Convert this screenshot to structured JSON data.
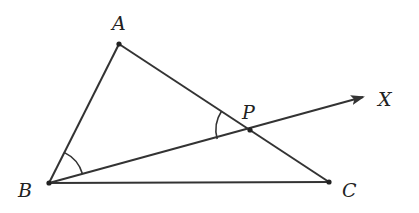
{
  "diagram": {
    "type": "geometry-triangle",
    "points": {
      "A": {
        "label": "A",
        "x": 119,
        "y": 44
      },
      "B": {
        "label": "B",
        "x": 49,
        "y": 183
      },
      "C": {
        "label": "C",
        "x": 329,
        "y": 182
      },
      "P": {
        "label": "P",
        "x": 250,
        "y": 130
      },
      "X": {
        "label": "X",
        "x": 363,
        "y": 97
      }
    },
    "segments": [
      "AB",
      "AC",
      "BC"
    ],
    "rays": [
      "BX"
    ],
    "angle_marks": [
      {
        "vertex": "B",
        "between": [
          "A",
          "P"
        ],
        "style": "single-arc"
      },
      {
        "vertex": "P",
        "between": [
          "A",
          "B"
        ],
        "style": "single-arc"
      }
    ],
    "colors": {
      "stroke": "#333333",
      "text": "#222222",
      "background": "#ffffff"
    }
  }
}
